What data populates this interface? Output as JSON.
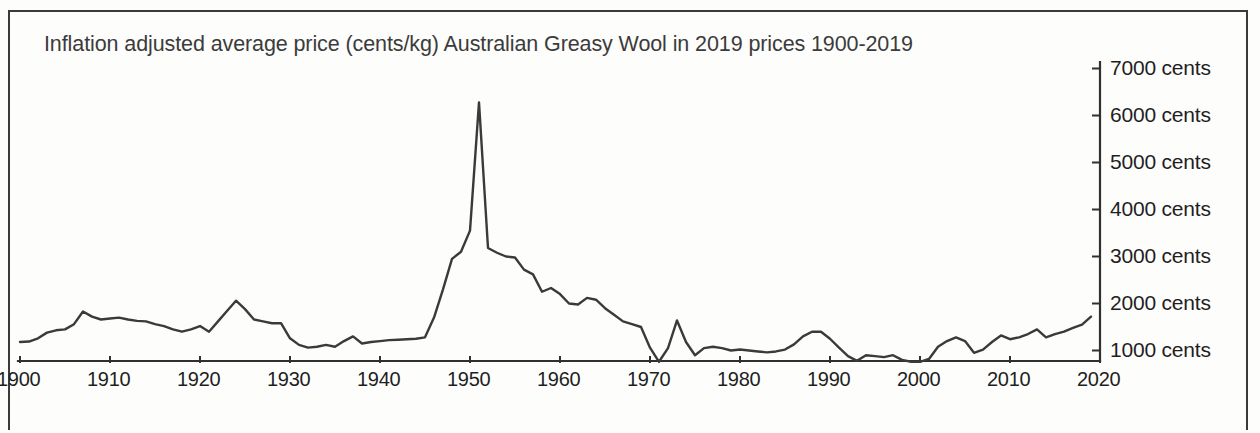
{
  "chart": {
    "title": "Inflation adjusted average price (cents/kg) Australian Greasy Wool in 2019 prices 1900-2019",
    "unit_suffix": "cents"
  },
  "axes": {
    "y_ticks": [
      {
        "value": 7000,
        "label": "7000 cents"
      },
      {
        "value": 6000,
        "label": "6000 cents"
      },
      {
        "value": 5000,
        "label": "5000 cents"
      },
      {
        "value": 4000,
        "label": "4000 cents"
      },
      {
        "value": 3000,
        "label": "3000 cents"
      },
      {
        "value": 2000,
        "label": "2000 cents"
      },
      {
        "value": 1000,
        "label": "1000 cents"
      }
    ],
    "x_ticks": [
      {
        "value": 1900,
        "label": "1900"
      },
      {
        "value": 1910,
        "label": "1910"
      },
      {
        "value": 1920,
        "label": "1920"
      },
      {
        "value": 1930,
        "label": "1930"
      },
      {
        "value": 1940,
        "label": "1940"
      },
      {
        "value": 1950,
        "label": "1950"
      },
      {
        "value": 1960,
        "label": "1960"
      },
      {
        "value": 1970,
        "label": "1970"
      },
      {
        "value": 1980,
        "label": "1980"
      },
      {
        "value": 1990,
        "label": "1990"
      },
      {
        "value": 2000,
        "label": "2000"
      },
      {
        "value": 2010,
        "label": "2010"
      },
      {
        "value": 2020,
        "label": "2020"
      }
    ]
  },
  "chart_data": {
    "type": "line",
    "title": "Inflation adjusted average price (cents/kg) Australian Greasy Wool in 2019 prices 1900-2019",
    "xlabel": "",
    "ylabel": "cents",
    "xlim": [
      1900,
      2020
    ],
    "ylim": [
      0,
      7400
    ],
    "grid": false,
    "legend": "none",
    "y_tick_values": [
      1000,
      2000,
      3000,
      4000,
      5000,
      6000,
      7000
    ],
    "y_tick_labels": [
      "1000 cents",
      "2000 cents",
      "3000 cents",
      "4000 cents",
      "5000 cents",
      "6000 cents",
      "7000 cents"
    ],
    "x_tick_values": [
      1900,
      1910,
      1920,
      1930,
      1940,
      1950,
      1960,
      1970,
      1980,
      1990,
      2000,
      2010,
      2020
    ],
    "x": [
      1900,
      1901,
      1902,
      1903,
      1904,
      1905,
      1906,
      1907,
      1908,
      1909,
      1910,
      1911,
      1912,
      1913,
      1914,
      1915,
      1916,
      1917,
      1918,
      1919,
      1920,
      1921,
      1922,
      1923,
      1924,
      1925,
      1926,
      1927,
      1928,
      1929,
      1930,
      1931,
      1932,
      1933,
      1934,
      1935,
      1936,
      1937,
      1938,
      1939,
      1940,
      1941,
      1942,
      1943,
      1944,
      1945,
      1946,
      1947,
      1948,
      1949,
      1950,
      1951,
      1952,
      1953,
      1954,
      1955,
      1956,
      1957,
      1958,
      1959,
      1960,
      1961,
      1962,
      1963,
      1964,
      1965,
      1966,
      1967,
      1968,
      1969,
      1970,
      1971,
      1972,
      1973,
      1974,
      1975,
      1976,
      1977,
      1978,
      1979,
      1980,
      1981,
      1982,
      1983,
      1984,
      1985,
      1986,
      1987,
      1988,
      1989,
      1990,
      1991,
      1992,
      1993,
      1994,
      1995,
      1996,
      1997,
      1998,
      1999,
      2000,
      2001,
      2002,
      2003,
      2004,
      2005,
      2006,
      2007,
      2008,
      2009,
      2010,
      2011,
      2012,
      2013,
      2014,
      2015,
      2016,
      2017,
      2018,
      2019
    ],
    "y": [
      1180,
      1190,
      1260,
      1380,
      1430,
      1450,
      1560,
      1830,
      1720,
      1660,
      1680,
      1700,
      1660,
      1630,
      1620,
      1560,
      1520,
      1450,
      1400,
      1450,
      1520,
      1400,
      1620,
      1840,
      2060,
      1880,
      1660,
      1620,
      1580,
      1580,
      1260,
      1120,
      1060,
      1080,
      1120,
      1080,
      1200,
      1300,
      1150,
      1180,
      1200,
      1220,
      1230,
      1240,
      1250,
      1280,
      1700,
      2300,
      2950,
      3100,
      3550,
      6280,
      3180,
      3080,
      3000,
      2980,
      2720,
      2620,
      2250,
      2330,
      2200,
      2000,
      1980,
      2120,
      2080,
      1900,
      1760,
      1620,
      1560,
      1500,
      1060,
      760,
      1050,
      1640,
      1180,
      900,
      1050,
      1080,
      1050,
      1000,
      1020,
      1000,
      980,
      960,
      980,
      1020,
      1130,
      1300,
      1400,
      1400,
      1250,
      1060,
      880,
      780,
      900,
      880,
      860,
      900,
      800,
      760,
      760,
      820,
      1080,
      1200,
      1280,
      1200,
      950,
      1020,
      1180,
      1320,
      1240,
      1280,
      1350,
      1450,
      1280,
      1350,
      1400,
      1480,
      1550,
      1720,
      1900,
      2080,
      1980,
      1680
    ],
    "annotations": [
      {
        "year": 1951,
        "value": 6280,
        "note": "Korean War wool boom peak"
      },
      {
        "year": 1924,
        "value": 2060,
        "note": "1920s high"
      },
      {
        "year": 1971,
        "value": 760,
        "note": "early 1970s low"
      },
      {
        "year": 2001,
        "value": 760,
        "note": "early 2000s low"
      },
      {
        "year": 2018,
        "value": 2080,
        "note": "recent high"
      }
    ]
  }
}
